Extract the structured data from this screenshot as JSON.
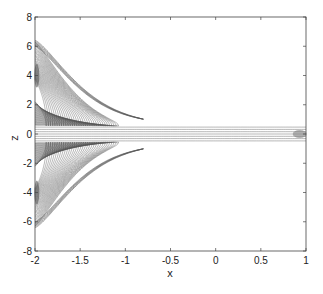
{
  "chart_data": {
    "type": "contour",
    "title": "",
    "xlabel": "x",
    "ylabel": "z",
    "xlim": [
      -2,
      1
    ],
    "ylim": [
      -8,
      8
    ],
    "xticks": [
      -2,
      -1.5,
      -1,
      -0.5,
      0,
      0.5,
      1
    ],
    "yticks": [
      -8,
      -6,
      -4,
      -2,
      0,
      2,
      4,
      6,
      8
    ],
    "xtick_labels": [
      "-2",
      "-1.5",
      "-1",
      "-0.5",
      "0",
      "0.5",
      "1"
    ],
    "ytick_labels": [
      "-8",
      "-6",
      "-4",
      "-2",
      "0",
      "2",
      "4",
      "6",
      "8"
    ],
    "grid": false,
    "legend": null,
    "line_color": "#555555",
    "envelope": {
      "x": [
        -2,
        -1.75,
        -1.5,
        -1.25,
        -1.0,
        -0.75,
        -0.5,
        0,
        0.5,
        0.8,
        1.0
      ],
      "z_upper": [
        6.4,
        4.6,
        3.0,
        1.7,
        0.8,
        0.6,
        0.55,
        0.5,
        0.5,
        0.45,
        0.5
      ],
      "z_lower": [
        -6.4,
        -4.6,
        -3.0,
        -1.7,
        -0.8,
        -0.6,
        -0.55,
        -0.5,
        -0.5,
        -0.45,
        -0.5
      ]
    },
    "n_contours_approx": 40
  }
}
